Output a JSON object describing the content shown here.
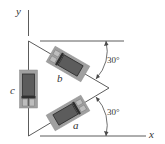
{
  "diagram": {
    "type": "strain-gauge-rosette",
    "axes": {
      "x_label": "x",
      "y_label": "y"
    },
    "gauges": [
      {
        "id": "a",
        "label": "a",
        "orientation_deg": 30,
        "position": "lower diagonal"
      },
      {
        "id": "b",
        "label": "b",
        "orientation_deg": -30,
        "position": "upper diagonal"
      },
      {
        "id": "c",
        "label": "c",
        "orientation_deg": 90,
        "position": "vertical left"
      }
    ],
    "angles": [
      {
        "label": "30°",
        "between": "upper diagonal and top horizontal"
      },
      {
        "label": "30°",
        "between": "lower diagonal and x-axis"
      }
    ],
    "colors": {
      "line": "#4a4a4a",
      "gauge_outer": "#9a9a9a",
      "gauge_inner": "#5a5a5a",
      "gauge_grid": "#3a3a3a",
      "tab": "#b8b8b8"
    }
  }
}
